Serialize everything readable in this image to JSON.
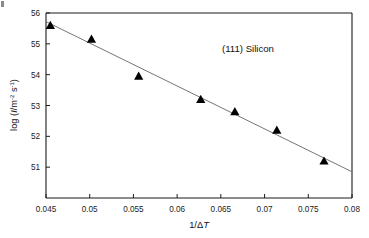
{
  "chart_data": {
    "type": "scatter",
    "title": "",
    "annotation": "(111) Silicon",
    "xlabel": "1/ΔT",
    "ylabel": "log (I/m⁻² s⁻¹)",
    "ylabel_parts": {
      "prefix": "log (",
      "symbol": "I",
      "divider": "/m",
      "exp1": "-2",
      "space": " s",
      "exp2": "-1",
      "suffix": ")"
    },
    "xlabel_parts": {
      "prefix": "1/",
      "delta": "Δ",
      "variable": "T"
    },
    "xlim": [
      0.045,
      0.08
    ],
    "ylim": [
      50.0,
      56.0
    ],
    "xticks": [
      0.045,
      0.05,
      0.055,
      0.06,
      0.065,
      0.07,
      0.075,
      0.08
    ],
    "xtick_labels": [
      "0.045",
      "0.05",
      "0.055",
      "0.06",
      "0.065",
      "0.07",
      "0.075",
      "0.08"
    ],
    "yticks": [
      51,
      52,
      53,
      54,
      55,
      56
    ],
    "ytick_labels": [
      "51",
      "52",
      "53",
      "54",
      "55",
      "56"
    ],
    "grid": false,
    "legend": null,
    "marker_style": "filled-triangle-up",
    "marker_color": "#000000",
    "fit_line_color": "#6d6d6d",
    "fit_line_style": "solid-thin",
    "x": [
      0.0455,
      0.0502,
      0.0556,
      0.0627,
      0.0666,
      0.0714,
      0.0768
    ],
    "y": [
      55.6,
      55.15,
      53.95,
      53.2,
      52.8,
      52.2,
      51.2
    ],
    "points": [
      {
        "x": 0.0455,
        "y": 55.6
      },
      {
        "x": 0.0502,
        "y": 55.15
      },
      {
        "x": 0.0556,
        "y": 53.95
      },
      {
        "x": 0.0627,
        "y": 53.2
      },
      {
        "x": 0.0666,
        "y": 52.8
      },
      {
        "x": 0.0714,
        "y": 52.2
      },
      {
        "x": 0.0768,
        "y": 51.2
      }
    ],
    "fit_line": {
      "x_start": 0.045,
      "y_start": 55.72,
      "x_end": 0.08,
      "y_end": 50.85
    }
  }
}
